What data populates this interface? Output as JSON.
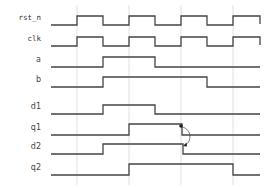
{
  "diagram": {
    "type": "timing-diagram",
    "colors": {
      "wave": "#444444",
      "grid": "#d8d8d8",
      "label": "#333333",
      "background": "#ffffff"
    },
    "gridlines_x": [
      77,
      129,
      181,
      233
    ],
    "signals": [
      {
        "name": "rst_n",
        "label": "rst_n",
        "y_low": 25,
        "y_high": 16,
        "levels": [
          [
            51,
            0
          ],
          [
            77,
            1
          ],
          [
            103,
            0
          ],
          [
            129,
            1
          ],
          [
            155,
            0
          ],
          [
            181,
            1
          ],
          [
            207,
            0
          ],
          [
            233,
            1
          ]
        ],
        "end_x": 260,
        "end_tick": true
      },
      {
        "name": "clk",
        "label": "clk",
        "y_low": 46,
        "y_high": 37,
        "levels": [
          [
            51,
            0
          ],
          [
            77,
            1
          ],
          [
            103,
            0
          ],
          [
            129,
            1
          ],
          [
            155,
            0
          ],
          [
            181,
            1
          ],
          [
            207,
            0
          ],
          [
            233,
            1
          ]
        ],
        "end_x": 260,
        "end_tick": true
      },
      {
        "name": "a",
        "label": "a",
        "y_low": 67,
        "y_high": 57,
        "levels": [
          [
            51,
            0
          ],
          [
            103,
            1
          ],
          [
            155,
            0
          ]
        ],
        "end_x": 260,
        "end_tick": false
      },
      {
        "name": "b",
        "label": "b",
        "y_low": 87,
        "y_high": 77,
        "levels": [
          [
            51,
            0
          ],
          [
            103,
            1
          ],
          [
            207,
            0
          ]
        ],
        "end_x": 260,
        "end_tick": false
      },
      {
        "name": "d1",
        "label": "d1",
        "y_low": 114,
        "y_high": 105,
        "levels": [
          [
            51,
            0
          ],
          [
            103,
            1
          ],
          [
            155,
            0
          ]
        ],
        "end_x": 260,
        "end_tick": false
      },
      {
        "name": "q1",
        "label": "q1",
        "y_low": 135,
        "y_high": 124,
        "levels": [
          [
            51,
            0
          ],
          [
            129,
            1
          ],
          [
            182,
            0
          ]
        ],
        "end_x": 260,
        "end_tick": false
      },
      {
        "name": "d2",
        "label": "d2",
        "y_low": 154,
        "y_high": 144,
        "levels": [
          [
            51,
            0
          ],
          [
            103,
            1
          ],
          [
            183,
            0
          ]
        ],
        "end_x": 260,
        "end_tick": false
      },
      {
        "name": "q2",
        "label": "q2",
        "y_low": 175,
        "y_high": 164,
        "levels": [
          [
            51,
            0
          ],
          [
            129,
            1
          ],
          [
            233,
            0
          ]
        ],
        "end_x": 260,
        "end_tick": false
      }
    ],
    "annotation": {
      "type": "causal-arrow",
      "from_signal": "q1",
      "to_signal": "d2",
      "from": [
        182,
        127
      ],
      "to": [
        184,
        146
      ]
    }
  }
}
